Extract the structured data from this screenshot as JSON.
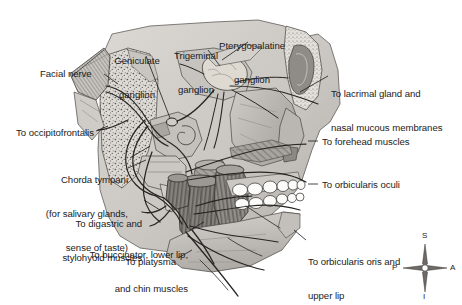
{
  "figure": {
    "style": "grayscale anatomical line illustration with stipple and hatch shading",
    "colors": {
      "background": "#ffffff",
      "ink": "#1b1b1b",
      "bone_light": "#d8d6d2",
      "bone_mid": "#b9b6b1",
      "bone_dark": "#8e8b86",
      "muscle_dark": "#6f6c68",
      "muscle_mid": "#908d88",
      "cartilage": "#cfccc7",
      "tooth": "#fbfbfa",
      "nerve_line": "#2a2a2a"
    },
    "labels_left": [
      {
        "name": "facial-nerve",
        "text": "Facial nerve",
        "lines": [
          "Facial nerve"
        ],
        "x": 40,
        "y": 68,
        "align": "left"
      },
      {
        "name": "to-occipitofrontalis",
        "text": "To occipitofrontalis",
        "lines": [
          "To occipitofrontalis"
        ],
        "x": 16,
        "y": 127,
        "align": "left"
      },
      {
        "name": "chorda-tympani",
        "text": "Chorda tympani (for salivary glands, sense of taste)",
        "lines": [
          "Chorda tympani",
          "(for salivary glands,",
          "sense of taste)"
        ],
        "x": 22,
        "y": 152,
        "align": "right"
      },
      {
        "name": "to-digastric-and-stylohyoid-muscles",
        "text": "To digastric and stylohyoid muscles",
        "lines": [
          "To digastric and",
          "stylohyoid muscles"
        ],
        "x": 32,
        "y": 196,
        "align": "right"
      },
      {
        "name": "to-buccinator-lower-lip-and-chin-muscles",
        "text": "To buccinator, lower lip, and chin muscles",
        "lines": [
          "To buccinator, lower lip,",
          "and chin muscles"
        ],
        "x": 44,
        "y": 227,
        "align": "right"
      },
      {
        "name": "to-platysma",
        "text": "To platysma",
        "lines": [
          "To platysma"
        ],
        "x": 100,
        "y": 256,
        "align": "right"
      }
    ],
    "labels_top": [
      {
        "name": "geniculate-ganglion",
        "text": "Geniculate ganglion",
        "lines": [
          "Geniculate",
          "ganglion"
        ],
        "x": 111,
        "y": 33,
        "align": "left"
      },
      {
        "name": "trigeminal-ganglion",
        "text": "Trigeminal ganglion",
        "lines": [
          "Trigeminal",
          "ganglion"
        ],
        "x": 168,
        "y": 28,
        "align": "left"
      },
      {
        "name": "pterygopalatine-ganglion",
        "text": "Pterygopalatine ganglion",
        "lines": [
          "Pterygopalatine",
          "ganglion"
        ],
        "x": 218,
        "y": 18,
        "align": "left"
      }
    ],
    "labels_right": [
      {
        "name": "to-lacrimal-gland-and-nasal-mucous-membranes",
        "text": "To lacrimal gland and nasal mucous membranes",
        "lines": [
          "To lacrimal gland and",
          "nasal mucous membranes"
        ],
        "x": 331,
        "y": 66,
        "align": "left"
      },
      {
        "name": "to-forehead-muscles",
        "text": "To forehead muscles",
        "lines": [
          "To forehead muscles"
        ],
        "x": 322,
        "y": 137,
        "align": "left"
      },
      {
        "name": "to-orbicularis-oculi",
        "text": "To orbicularis oculi",
        "lines": [
          "To orbicularis oculi"
        ],
        "x": 322,
        "y": 180,
        "align": "left"
      },
      {
        "name": "to-orbicularis-oris-and-upper-lip",
        "text": "To orbicularis oris and upper lip",
        "lines": [
          "To orbicularis oris and",
          "upper lip"
        ],
        "x": 308,
        "y": 237,
        "align": "left"
      }
    ],
    "compass": {
      "name": "orientation-compass",
      "center": {
        "x": 425,
        "y": 268
      },
      "superior": "S",
      "posterior": "P",
      "anterior": "A",
      "inferior": "I"
    }
  }
}
